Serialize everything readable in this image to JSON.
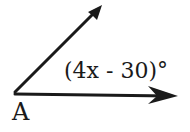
{
  "diagram": {
    "vertex_label": "A",
    "angle_expression": "(4x - 30)°",
    "rays": [
      {
        "name": "upper-ray",
        "from": [
          15,
          92
        ],
        "to": [
          102,
          5
        ]
      },
      {
        "name": "lower-ray",
        "from": [
          15,
          94
        ],
        "to": [
          178,
          96
        ]
      }
    ],
    "stroke_color": "#1a1a1a"
  }
}
